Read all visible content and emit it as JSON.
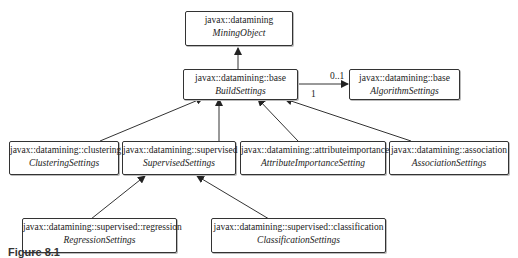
{
  "diagram": {
    "type": "UML class diagram",
    "nodes": [
      {
        "id": "mining_object",
        "package": "javax::datamining",
        "class": "MiningObject"
      },
      {
        "id": "build_settings",
        "package": "javax::datamining::base",
        "class": "BuildSettings"
      },
      {
        "id": "algorithm_settings",
        "package": "javax::datamining::base",
        "class": "AlgorithmSettings"
      },
      {
        "id": "clustering_settings",
        "package": "javax::datamining::clustering",
        "class": "ClusteringSettings"
      },
      {
        "id": "supervised_settings",
        "package": "javax::datamining::supervised",
        "class": "SupervisedSettings"
      },
      {
        "id": "attribute_importance_setting",
        "package": "javax::datamining::attributeimportance",
        "class": "AttributeImportanceSetting"
      },
      {
        "id": "association_settings",
        "package": "javax::datamining::association",
        "class": "AssociationSettings"
      },
      {
        "id": "regression_settings",
        "package": "javax::datamining::supervised::regression",
        "class": "RegressionSettings"
      },
      {
        "id": "classification_settings",
        "package": "javax::datamining::supervised::classification",
        "class": "ClassificationSettings"
      }
    ],
    "edges": [
      {
        "from": "build_settings",
        "to": "mining_object",
        "kind": "generalization"
      },
      {
        "from": "build_settings",
        "to": "algorithm_settings",
        "kind": "association",
        "source_multiplicity": "1",
        "target_multiplicity": "0..1"
      },
      {
        "from": "clustering_settings",
        "to": "build_settings",
        "kind": "generalization"
      },
      {
        "from": "supervised_settings",
        "to": "build_settings",
        "kind": "generalization"
      },
      {
        "from": "attribute_importance_setting",
        "to": "build_settings",
        "kind": "generalization"
      },
      {
        "from": "association_settings",
        "to": "build_settings",
        "kind": "generalization"
      },
      {
        "from": "regression_settings",
        "to": "supervised_settings",
        "kind": "generalization"
      },
      {
        "from": "classification_settings",
        "to": "supervised_settings",
        "kind": "generalization"
      }
    ],
    "multiplicity": {
      "target": "0..1",
      "source": "1"
    }
  },
  "caption": {
    "text": "Figure 8.1"
  }
}
